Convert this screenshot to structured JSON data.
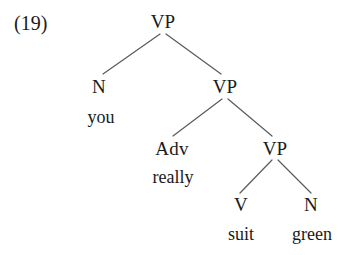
{
  "figure": {
    "example_number": "(19)",
    "type": "syntax-tree",
    "sentence": "you really suit green",
    "line_color": "#5a5a5a",
    "text_color": "#1a1a1a",
    "background_color": "#ffffff"
  },
  "nodes": [
    {
      "id": "vp1",
      "label": "VP",
      "x": 163,
      "y": 21
    },
    {
      "id": "n1",
      "label": "N",
      "x": 99,
      "y": 86
    },
    {
      "id": "vp2",
      "label": "VP",
      "x": 225,
      "y": 86
    },
    {
      "id": "adv",
      "label": "Adv",
      "x": 172,
      "y": 148
    },
    {
      "id": "vp3",
      "label": "VP",
      "x": 275,
      "y": 148
    },
    {
      "id": "v1",
      "label": "V",
      "x": 241,
      "y": 204
    },
    {
      "id": "n2",
      "label": "N",
      "x": 311,
      "y": 204
    }
  ],
  "leaves": [
    {
      "id": "you",
      "word": "you",
      "x": 101,
      "y": 117
    },
    {
      "id": "really",
      "word": "really",
      "x": 173,
      "y": 177
    },
    {
      "id": "suit",
      "word": "suit",
      "x": 241,
      "y": 234
    },
    {
      "id": "green",
      "word": "green",
      "x": 312,
      "y": 234
    }
  ],
  "branches": [
    {
      "id": "vp1-n1",
      "from": "vp1",
      "to": "n1",
      "x1": 160,
      "y1": 34,
      "x2": 103,
      "y2": 74
    },
    {
      "id": "vp1-vp2",
      "from": "vp1",
      "to": "vp2",
      "x1": 166,
      "y1": 34,
      "x2": 221,
      "y2": 74
    },
    {
      "id": "vp2-adv",
      "from": "vp2",
      "to": "adv",
      "x1": 222,
      "y1": 99,
      "x2": 173,
      "y2": 136
    },
    {
      "id": "vp2-vp3",
      "from": "vp2",
      "to": "vp3",
      "x1": 228,
      "y1": 99,
      "x2": 272,
      "y2": 136
    },
    {
      "id": "vp3-v1",
      "from": "vp3",
      "to": "v1",
      "x1": 272,
      "y1": 160,
      "x2": 240,
      "y2": 193
    },
    {
      "id": "vp3-n2",
      "from": "vp3",
      "to": "n2",
      "x1": 278,
      "y1": 160,
      "x2": 311,
      "y2": 193
    }
  ],
  "example_label_pos": {
    "x": 14,
    "y": 23
  }
}
